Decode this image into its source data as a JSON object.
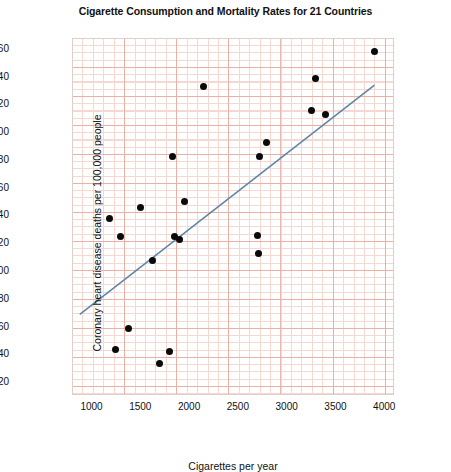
{
  "chart_data": {
    "type": "scatter",
    "title": "Cigarette Consumption and Mortality Rates for 21 Countries",
    "xlabel": "Cigarettes per year",
    "ylabel": "Coronary heart disease deaths per 100,000 people",
    "xlim": [
      800,
      4100
    ],
    "ylim": [
      10,
      267
    ],
    "xticks": [
      1000,
      1500,
      2000,
      2500,
      3000,
      3500,
      4000
    ],
    "yticks": [
      20,
      40,
      60,
      80,
      100,
      120,
      140,
      160,
      180,
      200,
      220,
      240,
      260
    ],
    "grid": true,
    "grid_color": "#e8a79c",
    "legend": "none",
    "point_color": "#0a0a0a",
    "points": [
      {
        "x": 1180,
        "y": 137
      },
      {
        "x": 1300,
        "y": 124
      },
      {
        "x": 1250,
        "y": 43
      },
      {
        "x": 1380,
        "y": 58
      },
      {
        "x": 1500,
        "y": 145
      },
      {
        "x": 1620,
        "y": 107
      },
      {
        "x": 1700,
        "y": 33
      },
      {
        "x": 1800,
        "y": 41
      },
      {
        "x": 1830,
        "y": 182
      },
      {
        "x": 1850,
        "y": 124
      },
      {
        "x": 1900,
        "y": 122
      },
      {
        "x": 1950,
        "y": 149
      },
      {
        "x": 2150,
        "y": 232
      },
      {
        "x": 2700,
        "y": 125
      },
      {
        "x": 2710,
        "y": 112
      },
      {
        "x": 2720,
        "y": 182
      },
      {
        "x": 2790,
        "y": 192
      },
      {
        "x": 3250,
        "y": 215
      },
      {
        "x": 3300,
        "y": 238
      },
      {
        "x": 3400,
        "y": 212
      },
      {
        "x": 3900,
        "y": 257
      }
    ],
    "trendline": {
      "type": "line",
      "color": "#5b87a8",
      "x": [
        880,
        3900
      ],
      "y": [
        68,
        233
      ]
    }
  }
}
